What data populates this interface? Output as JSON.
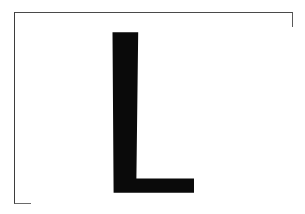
{
  "card": {
    "type": "letter-flashcard",
    "medium": "scanned paper card",
    "background_color": "#ffffff",
    "canvas_width": 305,
    "canvas_height": 214,
    "alt_text": "Uppercase letter L printed in bold black inside a thin rectangular border"
  },
  "frame": {
    "name": "border-rectangle",
    "stroke_color": "#4a4a4a",
    "stroke_width_px": 1.5,
    "left": 14,
    "top": 12,
    "width": 279,
    "height": 192,
    "fill_color": "#ffffff"
  },
  "glyph": {
    "character": "L",
    "case": "uppercase",
    "color": "#0a0a0a",
    "style": "bold sans-serif, slightly tapered stem",
    "bounds": {
      "left": 112,
      "top": 32,
      "right": 194,
      "bottom": 193,
      "width": 82,
      "height": 161
    },
    "stem": {
      "top_left_x": 112,
      "top_right_x": 138,
      "bottom_left_x": 113,
      "bottom_right_x": 136,
      "top_y": 32,
      "bottom_y": 193
    },
    "arm": {
      "top_y": 178,
      "bottom_y": 193,
      "right_x": 194,
      "inner_corner_x": 136,
      "inner_corner_y": 179
    },
    "path_d": "M 112.5 32.2 L 138.2 32.2 L 136.4 178.6 L 194.0 178.6 L 194.0 192.8 L 113.6 192.8 Z"
  }
}
